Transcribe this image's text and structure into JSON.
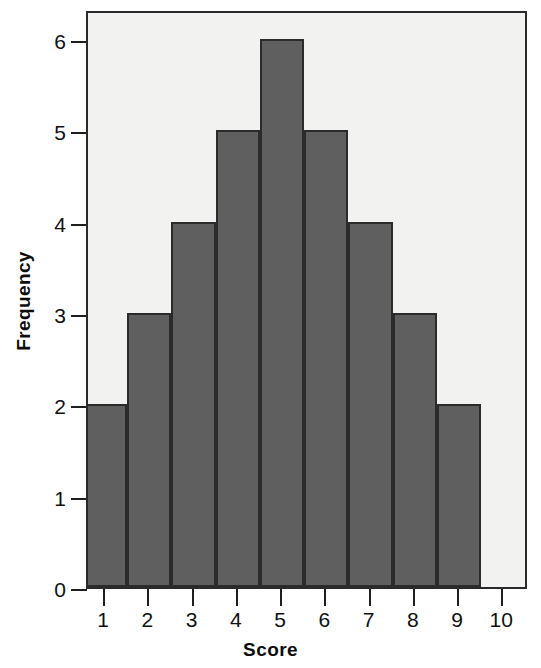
{
  "chart_data": {
    "type": "bar",
    "title": "",
    "subtitle": "",
    "xlabel": "Score",
    "ylabel": "Frequency",
    "categories": [
      "1",
      "2",
      "3",
      "4",
      "5",
      "6",
      "7",
      "8",
      "9"
    ],
    "values": [
      2,
      3,
      4,
      5,
      6,
      5,
      4,
      3,
      2
    ],
    "x_tick_labels": [
      "1",
      "2",
      "3",
      "4",
      "5",
      "6",
      "7",
      "8",
      "9",
      "10"
    ],
    "y_tick_labels": [
      "0",
      "1",
      "2",
      "3",
      "4",
      "5",
      "6"
    ],
    "y_tick_values": [
      0,
      1,
      2,
      3,
      4,
      5,
      6
    ],
    "xlim": [
      0.5,
      10.0
    ],
    "ylim": [
      0,
      6.3
    ],
    "grid": false,
    "legend": false,
    "legend_position": "none",
    "bar_color": "#5f5f5f",
    "bar_edge_color": "#2b2b2b",
    "plot_background": "#f2f2f0",
    "figure_background": "#ffffff",
    "axis_color": "#1e1e1e",
    "annotations": []
  }
}
